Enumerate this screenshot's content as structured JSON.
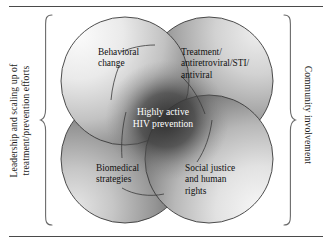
{
  "figure": {
    "type": "venn-four-circle-overlap"
  },
  "side_labels": {
    "left": "Leadership and scaling up of\ntreatment/prevention efforts",
    "right": "Community involvement"
  },
  "center": {
    "label": "Highly active\nHIV prevention",
    "text_color": "#ffffff"
  },
  "circles": [
    {
      "id": "behavioral-change",
      "label": "Behavioral\nchange",
      "position": "top-left",
      "fill_light": "#f2f2f2",
      "fill_dark": "#6f6f6f"
    },
    {
      "id": "treatment-antiretroviral-sti-antiviral",
      "label": "Treatment/\nantiretroviral/STI/\nantiviral",
      "position": "top-right",
      "fill_light": "#d8d8d8",
      "fill_dark": "#4b4b4b"
    },
    {
      "id": "biomedical-strategies",
      "label": "Biomedical\nstrategies",
      "position": "bottom-left",
      "fill_light": "#cfcfcf",
      "fill_dark": "#3d3d3d"
    },
    {
      "id": "social-justice-and-human-rights",
      "label": "Social justice\nand human\nrights",
      "position": "bottom-right",
      "fill_light": "#ededed",
      "fill_dark": "#6a6a6a"
    }
  ],
  "colors": {
    "rule": "#4a4a4a",
    "brace": "#6b6b6b",
    "outline": "#3a3a3a",
    "text": "#111111",
    "background": "#ffffff"
  }
}
